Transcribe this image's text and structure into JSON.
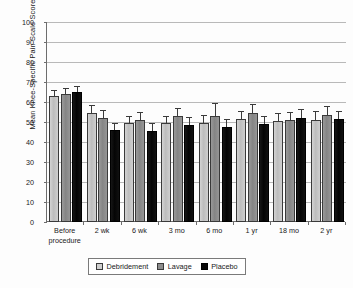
{
  "chart_data": {
    "type": "bar",
    "title": "",
    "xlabel": "",
    "ylabel": "Mean Knee-Specific Pain Scale Score",
    "ylim": [
      0,
      100
    ],
    "ytick_step": 10,
    "yticks": [
      0,
      10,
      20,
      30,
      40,
      50,
      60,
      70,
      80,
      90,
      100
    ],
    "ytick_labels": [
      "0",
      "10",
      "20",
      "30",
      "40",
      "50",
      "60",
      "70",
      "80",
      "90",
      "100"
    ],
    "grid": "horizontal",
    "legend_position": "bottom-center",
    "error_bars": "present",
    "categories": [
      "Before\nprocedure",
      "2 wk",
      "6 wk",
      "3 mo",
      "6 mo",
      "1 yr",
      "18 mo",
      "2 yr"
    ],
    "series": [
      {
        "name": "Debridement",
        "color": "#cccccc",
        "values": [
          62.8,
          54.6,
          49.3,
          49.4,
          49.7,
          51.5,
          50.6,
          51.2
        ],
        "err_low": [
          2.6,
          3.4,
          3.1,
          3.3,
          3.4,
          3.4,
          3.6,
          3.6
        ],
        "err_high": [
          2.6,
          3.4,
          3.1,
          3.3,
          3.4,
          3.4,
          3.6,
          3.6
        ]
      },
      {
        "name": "Lavage",
        "color": "#8d8d8d",
        "values": [
          63.9,
          52.0,
          51.0,
          52.9,
          53.2,
          54.7,
          50.9,
          53.6
        ],
        "err_low": [
          2.5,
          3.6,
          3.3,
          3.6,
          3.7,
          4.0,
          3.8,
          3.9
        ],
        "err_high": [
          2.5,
          3.6,
          3.3,
          3.6,
          5.7,
          4.0,
          3.8,
          3.9
        ]
      },
      {
        "name": "Placebo",
        "color": "#050505",
        "values": [
          64.9,
          45.8,
          45.6,
          48.7,
          47.6,
          48.8,
          52.2,
          51.4
        ],
        "err_low": [
          2.8,
          3.1,
          3.2,
          3.4,
          3.2,
          3.6,
          3.8,
          3.7
        ],
        "err_high": [
          2.8,
          3.1,
          3.2,
          3.4,
          3.2,
          3.6,
          3.8,
          3.7
        ]
      }
    ]
  },
  "legend": {
    "items": [
      {
        "label": "Debridement"
      },
      {
        "label": "Lavage"
      },
      {
        "label": "Placebo"
      }
    ]
  }
}
